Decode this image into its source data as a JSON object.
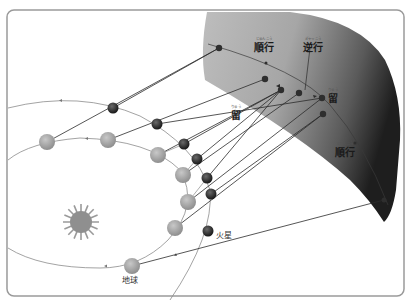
{
  "diagram": {
    "labels": {
      "prograde_top": {
        "ruby": "じゅんこう",
        "text": "順行"
      },
      "retrograde": {
        "ruby": "ぎゃっこう",
        "text": "逆行"
      },
      "stationary_right": {
        "ruby": "りゅう",
        "text": "留"
      },
      "stationary_left": {
        "ruby": "りゅう",
        "text": "留"
      },
      "prograde_bottom": {
        "ruby": "じゅんこう",
        "text": "順行"
      },
      "mars": "火星",
      "earth": "地球"
    },
    "colors": {
      "frame": "#9a9a9a",
      "sphere_light": "#d8d8d8",
      "sphere_dark": "#2a2a2a",
      "orbit": "#8c8c8c",
      "sight_line": "#2b2b2b",
      "earth": "#9e9e9e",
      "mars": "#333333",
      "sun": "#8f8f8f"
    },
    "earth_positions": [
      [
        47,
        142
      ],
      [
        108,
        140
      ],
      [
        158,
        155
      ],
      [
        183,
        175
      ],
      [
        188,
        202
      ],
      [
        175,
        228
      ],
      [
        132,
        266
      ]
    ],
    "mars_positions": [
      [
        113,
        108
      ],
      [
        157,
        124
      ],
      [
        184,
        144
      ],
      [
        197,
        159
      ],
      [
        207,
        178
      ],
      [
        211,
        194
      ],
      [
        208,
        231
      ]
    ],
    "sky_positions": [
      [
        219,
        48
      ],
      [
        265,
        79
      ],
      [
        281,
        90
      ],
      [
        299,
        93
      ],
      [
        322,
        98
      ],
      [
        323,
        114
      ],
      [
        384,
        200
      ]
    ]
  }
}
